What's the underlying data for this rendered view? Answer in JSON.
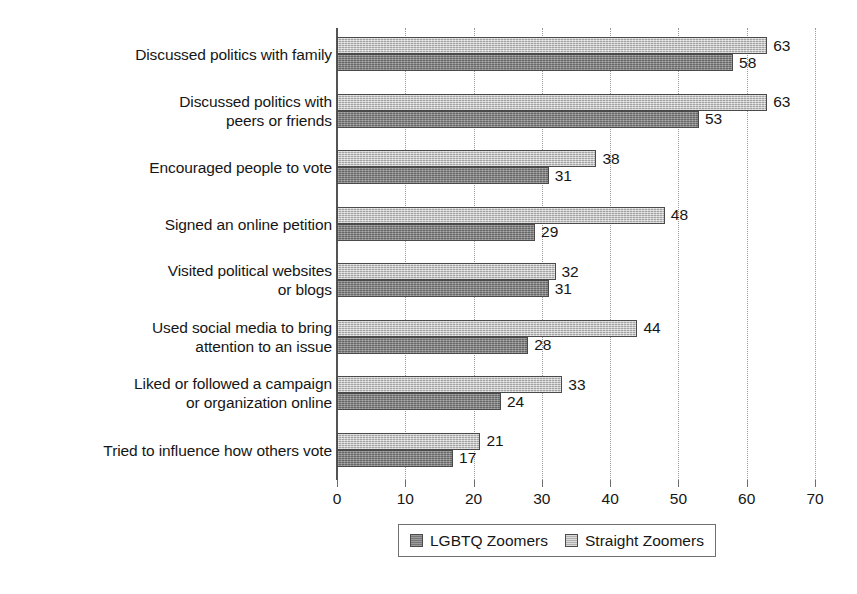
{
  "chart_data": {
    "type": "bar",
    "orientation": "horizontal",
    "title": "",
    "subtitle": "",
    "xlabel": "",
    "ylabel": "",
    "xlim": [
      0,
      70
    ],
    "xticks": [
      0,
      10,
      20,
      30,
      40,
      50,
      60,
      70
    ],
    "tick_labels": [
      "0",
      "10",
      "20",
      "30",
      "40",
      "50",
      "60",
      "70"
    ],
    "grid": "vertical-dotted",
    "legend_position": "bottom-center",
    "categories": [
      "Discussed politics with family",
      "Discussed politics with\npeers or friends",
      "Encouraged people to vote",
      "Signed an online petition",
      "Visited political websites\nor blogs",
      "Used social media to bring\nattention to an issue",
      "Liked or followed a campaign\nor organization online",
      "Tried to influence how others vote"
    ],
    "series": [
      {
        "name": "LGBTQ Zoomers",
        "color": "#838383",
        "values": [
          58,
          53,
          31,
          29,
          31,
          28,
          24,
          17
        ],
        "value_labels": [
          "58",
          "53",
          "31",
          "29",
          "31",
          "28",
          "24",
          "17"
        ]
      },
      {
        "name": "Straight Zoomers",
        "color": "#b8b8b8",
        "values": [
          63,
          63,
          38,
          48,
          32,
          44,
          33,
          21
        ],
        "value_labels": [
          "63",
          "63",
          "38",
          "48",
          "32",
          "44",
          "33",
          "21"
        ]
      }
    ]
  },
  "legend": {
    "items": [
      {
        "label": "LGBTQ Zoomers",
        "swatch": "dark"
      },
      {
        "label": "Straight Zoomers",
        "swatch": "light"
      }
    ]
  },
  "colors": {
    "background": "#ffffff",
    "axis": "#545454",
    "gridline": "#9a9a9a",
    "text": "#161616",
    "series_dark": "#838383",
    "series_light": "#b8b8b8"
  }
}
